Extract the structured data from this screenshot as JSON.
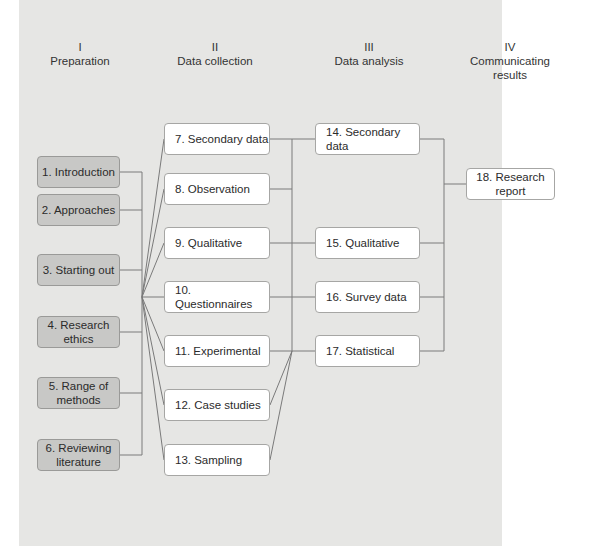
{
  "colors": {
    "panel_bg": "#e6e6e4",
    "prep_box_bg": "#c8c8c6",
    "box_bg": "#ffffff",
    "line": "#7a7a7a"
  },
  "stages": [
    {
      "numeral": "I",
      "title": "Preparation"
    },
    {
      "numeral": "II",
      "title": "Data collection"
    },
    {
      "numeral": "III",
      "title": "Data analysis"
    },
    {
      "numeral": "IV",
      "title": "Communicating\nresults"
    }
  ],
  "preparation": [
    {
      "label": "1. Introduction"
    },
    {
      "label": "2. Approaches"
    },
    {
      "label": "3. Starting out"
    },
    {
      "label": "4. Research\nethics"
    },
    {
      "label": "5. Range of\nmethods"
    },
    {
      "label": "6. Reviewing\nliterature"
    }
  ],
  "data_collection": [
    {
      "label": "7. Secondary data"
    },
    {
      "label": "8. Observation"
    },
    {
      "label": "9. Qualitative"
    },
    {
      "label": "10. Questionnaires"
    },
    {
      "label": "11. Experimental"
    },
    {
      "label": "12. Case studies"
    },
    {
      "label": "13. Sampling"
    }
  ],
  "data_analysis": [
    {
      "label": "14. Secondary data"
    },
    {
      "label": "15. Qualitative"
    },
    {
      "label": "16. Survey data"
    },
    {
      "label": "17. Statistical"
    }
  ],
  "communicating": [
    {
      "label": "18. Research\nreport"
    }
  ]
}
